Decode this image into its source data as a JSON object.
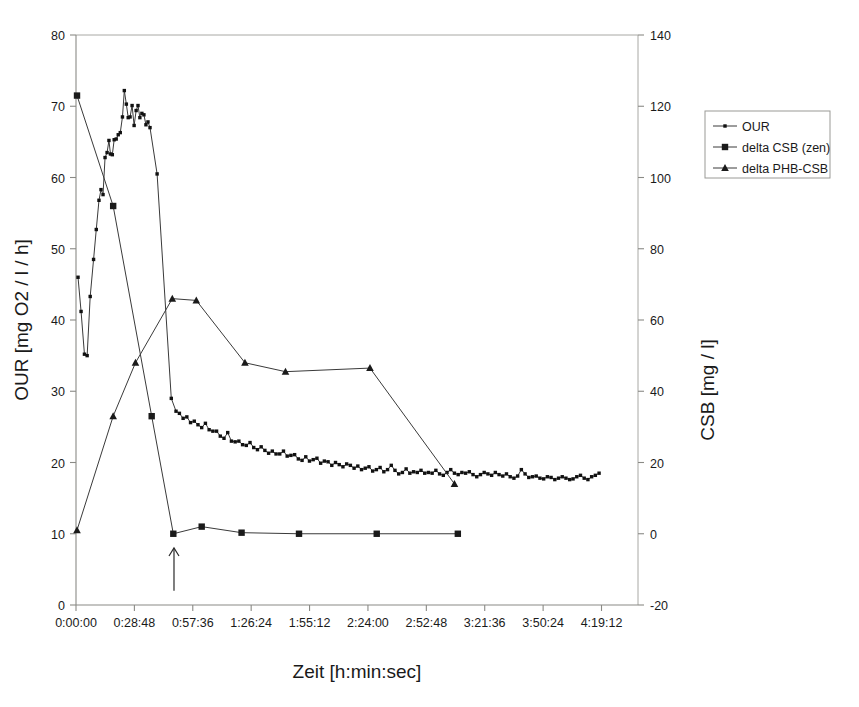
{
  "chart_data": {
    "type": "line",
    "title": "",
    "xlabel": "Zeit [h:min:sec]",
    "ylabel": "OUR [mg O2 / l / h]",
    "y2label": "CSB [mg / l]",
    "grid": false,
    "legend_position": "right",
    "xlim": [
      0,
      16632
    ],
    "ylim": [
      0,
      80
    ],
    "y2lim": [
      -20,
      140
    ],
    "x_tick_labels": [
      "0:00:00",
      "0:28:48",
      "0:57:36",
      "1:26:24",
      "1:55:12",
      "2:24:00",
      "2:52:48",
      "3:21:36",
      "3:50:24",
      "4:19:12"
    ],
    "x_tick_values": [
      0,
      1728,
      3456,
      5184,
      6912,
      8640,
      10368,
      12096,
      13824,
      15552
    ],
    "y_tick_labels": [
      "0",
      "10",
      "20",
      "30",
      "40",
      "50",
      "60",
      "70",
      "80"
    ],
    "y_tick_values": [
      0,
      10,
      20,
      30,
      40,
      50,
      60,
      70,
      80
    ],
    "y2_tick_labels": [
      "-20",
      "0",
      "20",
      "40",
      "60",
      "80",
      "100",
      "120",
      "140"
    ],
    "y2_tick_values": [
      -20,
      0,
      20,
      40,
      60,
      80,
      100,
      120,
      140
    ],
    "annotations": [
      {
        "name": "up-arrow-marker",
        "x": 2900,
        "y_from": 2.0,
        "y_to": 8.0,
        "note": ""
      }
    ],
    "series": [
      {
        "name": "OUR",
        "axis": "left",
        "marker": "dot",
        "points": [
          [
            60,
            46.0
          ],
          [
            150,
            41.2
          ],
          [
            250,
            35.2
          ],
          [
            330,
            35.0
          ],
          [
            420,
            43.3
          ],
          [
            520,
            48.5
          ],
          [
            600,
            52.7
          ],
          [
            680,
            56.8
          ],
          [
            740,
            58.3
          ],
          [
            800,
            57.6
          ],
          [
            860,
            62.8
          ],
          [
            920,
            63.5
          ],
          [
            975,
            65.2
          ],
          [
            1020,
            63.3
          ],
          [
            1075,
            63.2
          ],
          [
            1130,
            65.3
          ],
          [
            1190,
            65.4
          ],
          [
            1250,
            66.0
          ],
          [
            1310,
            66.3
          ],
          [
            1375,
            68.5
          ],
          [
            1430,
            72.2
          ],
          [
            1490,
            70.3
          ],
          [
            1545,
            68.4
          ],
          [
            1600,
            68.5
          ],
          [
            1660,
            70.1
          ],
          [
            1720,
            67.3
          ],
          [
            1780,
            69.4
          ],
          [
            1835,
            70.1
          ],
          [
            1890,
            68.4
          ],
          [
            1950,
            69.0
          ],
          [
            2010,
            68.8
          ],
          [
            2070,
            67.4
          ],
          [
            2130,
            67.8
          ],
          [
            2190,
            67.0
          ],
          [
            2400,
            60.5
          ],
          [
            2820,
            29.0
          ],
          [
            2960,
            27.2
          ],
          [
            3060,
            26.9
          ],
          [
            3170,
            26.2
          ],
          [
            3280,
            26.4
          ],
          [
            3390,
            25.6
          ],
          [
            3500,
            25.8
          ],
          [
            3610,
            25.3
          ],
          [
            3720,
            24.9
          ],
          [
            3830,
            25.5
          ],
          [
            3940,
            24.6
          ],
          [
            4050,
            24.4
          ],
          [
            4160,
            24.4
          ],
          [
            4270,
            23.7
          ],
          [
            4380,
            23.4
          ],
          [
            4490,
            24.2
          ],
          [
            4600,
            23.0
          ],
          [
            4710,
            22.9
          ],
          [
            4820,
            23.0
          ],
          [
            4930,
            22.5
          ],
          [
            5040,
            22.4
          ],
          [
            5150,
            22.8
          ],
          [
            5260,
            22.1
          ],
          [
            5370,
            21.8
          ],
          [
            5480,
            22.2
          ],
          [
            5590,
            21.7
          ],
          [
            5700,
            21.3
          ],
          [
            5810,
            21.6
          ],
          [
            5920,
            21.2
          ],
          [
            6030,
            21.2
          ],
          [
            6140,
            21.6
          ],
          [
            6250,
            20.9
          ],
          [
            6360,
            21.0
          ],
          [
            6470,
            21.1
          ],
          [
            6580,
            20.5
          ],
          [
            6690,
            20.3
          ],
          [
            6800,
            20.8
          ],
          [
            6910,
            20.2
          ],
          [
            7020,
            20.4
          ],
          [
            7130,
            20.6
          ],
          [
            7240,
            19.9
          ],
          [
            7350,
            20.2
          ],
          [
            7460,
            20.1
          ],
          [
            7570,
            19.6
          ],
          [
            7680,
            20.0
          ],
          [
            7790,
            19.7
          ],
          [
            7900,
            19.4
          ],
          [
            8010,
            19.8
          ],
          [
            8120,
            19.6
          ],
          [
            8230,
            19.2
          ],
          [
            8340,
            19.5
          ],
          [
            8450,
            19.0
          ],
          [
            8560,
            19.2
          ],
          [
            8670,
            19.4
          ],
          [
            8780,
            18.8
          ],
          [
            8890,
            19.0
          ],
          [
            9000,
            19.3
          ],
          [
            9110,
            18.7
          ],
          [
            9220,
            19.0
          ],
          [
            9330,
            19.6
          ],
          [
            9440,
            18.9
          ],
          [
            9550,
            18.4
          ],
          [
            9660,
            18.6
          ],
          [
            9770,
            19.1
          ],
          [
            9880,
            18.5
          ],
          [
            9990,
            18.7
          ],
          [
            10100,
            18.6
          ],
          [
            10210,
            18.9
          ],
          [
            10320,
            18.5
          ],
          [
            10430,
            18.6
          ],
          [
            10540,
            18.5
          ],
          [
            10650,
            18.9
          ],
          [
            10760,
            18.4
          ],
          [
            10870,
            18.2
          ],
          [
            10980,
            18.6
          ],
          [
            11090,
            19.0
          ],
          [
            11200,
            18.5
          ],
          [
            11310,
            18.3
          ],
          [
            11420,
            18.6
          ],
          [
            11530,
            18.5
          ],
          [
            11640,
            18.7
          ],
          [
            11750,
            18.3
          ],
          [
            11860,
            18.0
          ],
          [
            11970,
            18.3
          ],
          [
            12080,
            18.6
          ],
          [
            12190,
            18.4
          ],
          [
            12300,
            18.2
          ],
          [
            12410,
            18.6
          ],
          [
            12520,
            18.3
          ],
          [
            12630,
            18.1
          ],
          [
            12740,
            18.4
          ],
          [
            12850,
            18.0
          ],
          [
            12960,
            17.8
          ],
          [
            13070,
            18.1
          ],
          [
            13180,
            19.0
          ],
          [
            13290,
            18.4
          ],
          [
            13400,
            17.9
          ],
          [
            13510,
            18.0
          ],
          [
            13620,
            18.1
          ],
          [
            13730,
            17.8
          ],
          [
            13840,
            17.7
          ],
          [
            13950,
            18.0
          ],
          [
            14060,
            17.9
          ],
          [
            14170,
            17.6
          ],
          [
            14280,
            17.8
          ],
          [
            14390,
            18.0
          ],
          [
            14500,
            17.8
          ],
          [
            14610,
            17.6
          ],
          [
            14710,
            17.7
          ],
          [
            14820,
            18.0
          ],
          [
            14930,
            18.2
          ],
          [
            15040,
            17.8
          ],
          [
            15150,
            17.6
          ],
          [
            15260,
            18.0
          ],
          [
            15370,
            18.2
          ],
          [
            15480,
            18.5
          ]
        ]
      },
      {
        "name": "delta CSB (zen)",
        "axis": "right",
        "marker": "square",
        "points": [
          [
            30,
            123.0
          ],
          [
            1100,
            92.0
          ],
          [
            2240,
            33.0
          ],
          [
            2880,
            0.0
          ],
          [
            3720,
            2.0
          ],
          [
            4900,
            0.3
          ],
          [
            6600,
            0.0
          ],
          [
            8900,
            0.0
          ],
          [
            11300,
            0.0
          ]
        ]
      },
      {
        "name": "delta PHB-CSB",
        "axis": "right",
        "marker": "triangle",
        "points": [
          [
            30,
            1.0
          ],
          [
            1100,
            33.0
          ],
          [
            1760,
            48.0
          ],
          [
            2850,
            66.0
          ],
          [
            3560,
            65.5
          ],
          [
            5000,
            48.0
          ],
          [
            6200,
            45.5
          ],
          [
            8700,
            46.5
          ],
          [
            11200,
            14.0
          ]
        ]
      }
    ]
  },
  "legend": {
    "entries": [
      {
        "label": "OUR",
        "marker": "dot"
      },
      {
        "label": "delta CSB (zen)",
        "marker": "square"
      },
      {
        "label": "delta PHB-CSB",
        "marker": "triangle"
      }
    ]
  }
}
